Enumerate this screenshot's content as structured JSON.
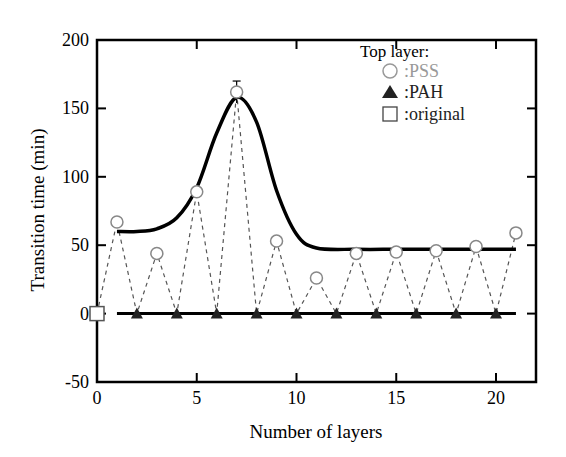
{
  "chart_data": {
    "type": "line",
    "title": "",
    "xlabel": "Number of layers",
    "ylabel": "Transition time (min)",
    "xlim": [
      0,
      22
    ],
    "ylim": [
      -50,
      200
    ],
    "xticks": [
      0,
      5,
      10,
      15,
      20
    ],
    "yticks": [
      -50,
      0,
      50,
      100,
      150,
      200
    ],
    "grid": false,
    "legend": {
      "title": "Top layer:",
      "position": "upper right",
      "entries": [
        {
          "marker": "open-circle",
          "label": ":PSS"
        },
        {
          "marker": "filled-triangle",
          "label": ":PAH"
        },
        {
          "marker": "open-square",
          "label": ":original"
        }
      ]
    },
    "series": [
      {
        "name": "PSS",
        "marker": "open-circle",
        "x": [
          1,
          3,
          5,
          7,
          9,
          11,
          13,
          15,
          17,
          19,
          21
        ],
        "y": [
          67,
          44,
          89,
          162,
          53,
          26,
          44,
          45,
          46,
          49,
          59
        ],
        "error_bars": {
          "7": 8
        }
      },
      {
        "name": "PAH",
        "marker": "filled-triangle",
        "x": [
          2,
          4,
          6,
          8,
          10,
          12,
          14,
          16,
          18,
          20
        ],
        "y": [
          0,
          0,
          0,
          0,
          0,
          0,
          0,
          0,
          0,
          0
        ]
      },
      {
        "name": "original",
        "marker": "open-square",
        "x": [
          0
        ],
        "y": [
          0
        ]
      },
      {
        "name": "PSS trend (guide)",
        "style": "thick-solid",
        "x": [
          1,
          2,
          3,
          4,
          5,
          6,
          7,
          8,
          9,
          10,
          11,
          13,
          15,
          17,
          19,
          21
        ],
        "y": [
          60,
          60,
          62,
          70,
          92,
          132,
          158,
          140,
          90,
          58,
          48,
          47,
          47,
          47,
          47,
          47
        ]
      },
      {
        "name": "PAH trend (guide)",
        "style": "thick-solid",
        "x": [
          1,
          21
        ],
        "y": [
          0,
          0
        ]
      }
    ],
    "connector": "dashed line connecting all points in layer order 0-21"
  }
}
